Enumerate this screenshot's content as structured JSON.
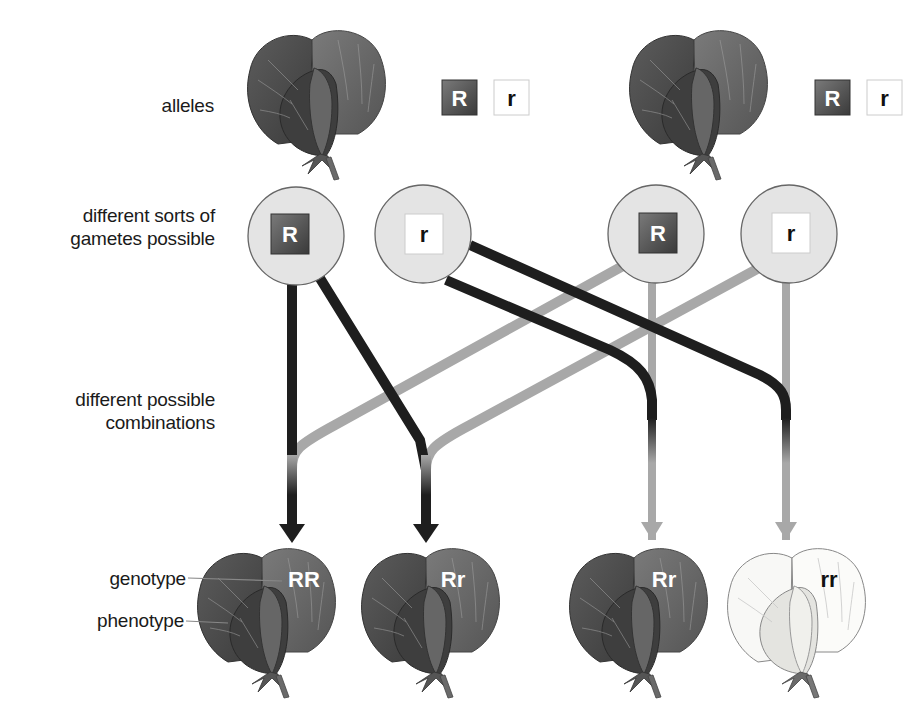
{
  "labels": {
    "alleles": "alleles",
    "gametes_line1": "different sorts of",
    "gametes_line2": "gametes possible",
    "combinations_line1": "different possible",
    "combinations_line2": "combinations",
    "genotype": "genotype",
    "phenotype": "phenotype"
  },
  "parents": [
    {
      "alleles": [
        "R",
        "r"
      ]
    },
    {
      "alleles": [
        "R",
        "r"
      ]
    }
  ],
  "gametes": [
    "R",
    "r",
    "R",
    "r"
  ],
  "offspring": [
    {
      "genotype": "RR",
      "phenotype": "purple"
    },
    {
      "genotype": "Rr",
      "phenotype": "purple"
    },
    {
      "genotype": "Rr",
      "phenotype": "purple"
    },
    {
      "genotype": "rr",
      "phenotype": "white"
    }
  ],
  "colors": {
    "dominant_path": "#1e1e1e",
    "recessive_path": "#a8a8a8",
    "gamete_fill": "#e4e4e4",
    "flower_dark": "#4a4a4a",
    "flower_mid": "#6e6e6e",
    "flower_white": "#f6f6f4"
  }
}
